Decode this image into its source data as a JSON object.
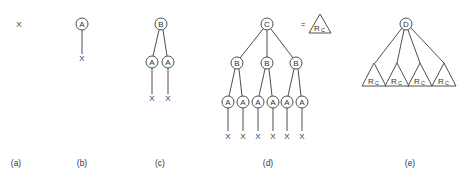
{
  "diagram": {
    "panels": [
      {
        "id": "a",
        "caption": "(a)",
        "root": "X"
      },
      {
        "id": "b",
        "caption": "(b)",
        "root": "A",
        "leaf": "X"
      },
      {
        "id": "c",
        "caption": "(c)",
        "root": "B",
        "children": [
          "A",
          "A"
        ],
        "leaves": [
          "X",
          "X"
        ]
      },
      {
        "id": "d",
        "caption": "(d)",
        "root": "C",
        "children": [
          "B",
          "B",
          "B"
        ],
        "grandchildren": [
          "A",
          "A",
          "A",
          "A",
          "A",
          "A"
        ],
        "leaves": [
          "X",
          "X",
          "X",
          "X",
          "X",
          "X"
        ],
        "equals_symbol": "=",
        "equivalent_subtree": {
          "label": "R",
          "subscript": "C"
        }
      },
      {
        "id": "e",
        "caption": "(e)",
        "root": "D",
        "subtrees": [
          {
            "label": "R",
            "subscript": "C"
          },
          {
            "label": "R",
            "subscript": "C"
          },
          {
            "label": "R",
            "subscript": "C"
          },
          {
            "label": "R",
            "subscript": "C"
          }
        ]
      }
    ]
  }
}
